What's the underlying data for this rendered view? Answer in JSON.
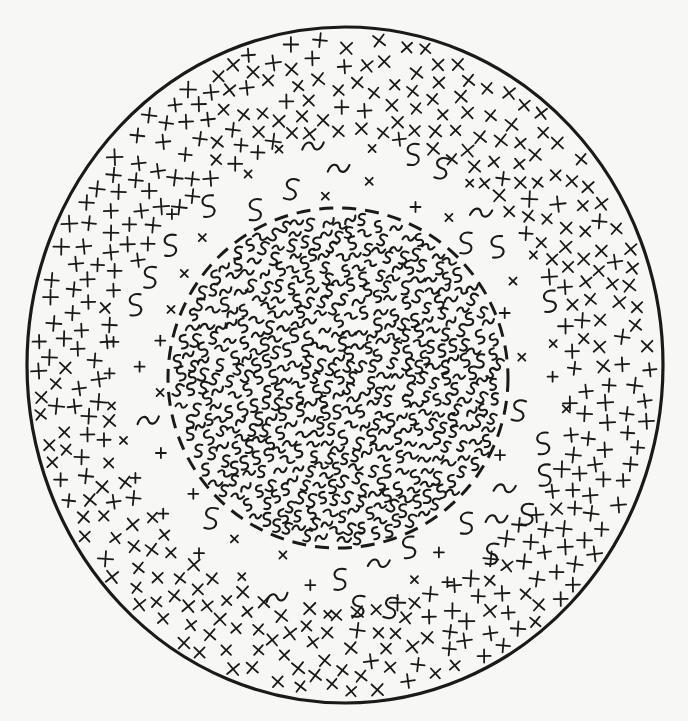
{
  "figure": {
    "type": "concentric-zone-diagram",
    "colors": {
      "ink": "#1a1a1a",
      "paper": "#f7f7f5"
    },
    "outer_boundary": {
      "style": "solid",
      "cx": 345,
      "cy": 365,
      "rx": 318,
      "ry": 338,
      "stroke_width": 3.2
    },
    "inner_boundary": {
      "style": "dashed",
      "cx": 338,
      "cy": 378,
      "r": 170,
      "stroke_width": 3,
      "dash": "14 9"
    },
    "zones": [
      {
        "name": "core",
        "glyphs": [
          "S",
          "~"
        ],
        "density": "dense",
        "r_min": 0,
        "r_max": 162
      },
      {
        "name": "transition-band",
        "glyphs": [
          "S",
          "~",
          "×",
          "+"
        ],
        "density": "sparse",
        "r_min": 178,
        "r_max": 232
      },
      {
        "name": "outer-shell",
        "glyphs": [
          "+",
          "×"
        ],
        "density": "dense",
        "r_min": 232,
        "r_max": 330
      }
    ]
  }
}
